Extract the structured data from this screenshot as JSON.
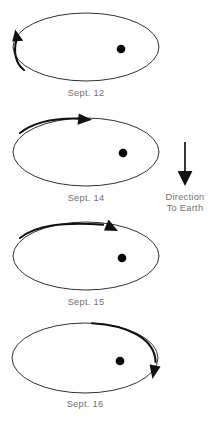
{
  "figure": {
    "title": "",
    "background_color": "#ffffff",
    "stroke_color": "#1a1a1a",
    "arrow_color": "#111111",
    "label_color": "#6f6f6f",
    "dot_color": "#000000"
  },
  "frames": [
    {
      "id": "frame-sept-12",
      "label": "Sept. 12",
      "ellipse": {
        "cx": 86,
        "cy": 47,
        "rx": 73,
        "ry": 34
      },
      "dot": {
        "cx": 121,
        "cy": 49,
        "r": 4.3
      },
      "arrow": {
        "name": "orbit-direction-arrow",
        "description": "short arc along the left edge sweeping upward",
        "head_direction": "up-right"
      }
    },
    {
      "id": "frame-sept-14",
      "label": "Sept. 14",
      "ellipse": {
        "cx": 86,
        "cy": 152,
        "rx": 73,
        "ry": 34
      },
      "dot": {
        "cx": 123,
        "cy": 153,
        "r": 4.3
      },
      "arrow": {
        "name": "orbit-direction-arrow",
        "description": "arc along the upper-left sweeping to top centre",
        "head_direction": "right"
      }
    },
    {
      "id": "frame-sept-15",
      "label": "Sept. 15",
      "ellipse": {
        "cx": 86,
        "cy": 256,
        "rx": 73,
        "ry": 34
      },
      "dot": {
        "cx": 122,
        "cy": 258,
        "r": 4.3
      },
      "arrow": {
        "name": "orbit-direction-arrow",
        "description": "arc along the top sweeping past centre toward the right",
        "head_direction": "down-right"
      }
    },
    {
      "id": "frame-sept-16",
      "label": "Sept. 16",
      "ellipse": {
        "cx": 85,
        "cy": 358,
        "rx": 73,
        "ry": 35
      },
      "dot": {
        "cx": 120,
        "cy": 361,
        "r": 4.3
      },
      "arrow": {
        "name": "orbit-direction-arrow",
        "description": "arc from top centre around the right edge sweeping downward",
        "head_direction": "down-left"
      }
    }
  ],
  "legend": {
    "id": "direction-to-earth-legend",
    "arrow_name": "direction-to-earth-arrow",
    "arrow_direction": "down",
    "line1": "Direction",
    "line2": "To Earth"
  }
}
